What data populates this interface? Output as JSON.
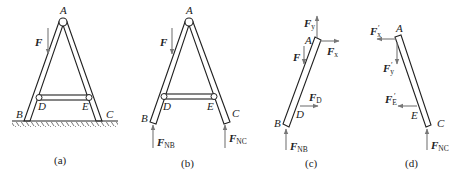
{
  "figure": {
    "panels": [
      {
        "id": "a",
        "caption": "(a)",
        "points": {
          "A": "A",
          "B": "B",
          "C": "C",
          "D": "D",
          "E": "E"
        },
        "forces": [
          {
            "name": "F",
            "sub": "",
            "prime": ""
          }
        ],
        "ground": true
      },
      {
        "id": "b",
        "caption": "(b)",
        "points": {
          "A": "A",
          "B": "B",
          "C": "C",
          "D": "D",
          "E": "E"
        },
        "forces": [
          {
            "name": "F",
            "sub": "",
            "prime": ""
          },
          {
            "name": "F",
            "sub": "NB",
            "prime": ""
          },
          {
            "name": "F",
            "sub": "NC",
            "prime": ""
          }
        ]
      },
      {
        "id": "c",
        "caption": "(c)",
        "points": {
          "A": "A",
          "B": "B",
          "D": "D"
        },
        "forces": [
          {
            "name": "F",
            "sub": "y",
            "prime": ""
          },
          {
            "name": "F",
            "sub": "x",
            "prime": ""
          },
          {
            "name": "F",
            "sub": "",
            "prime": ""
          },
          {
            "name": "F",
            "sub": "D",
            "prime": ""
          },
          {
            "name": "F",
            "sub": "NB",
            "prime": ""
          }
        ]
      },
      {
        "id": "d",
        "caption": "(d)",
        "points": {
          "A": "A",
          "C": "C",
          "E": "E"
        },
        "forces": [
          {
            "name": "F",
            "sub": "x",
            "prime": "′"
          },
          {
            "name": "F",
            "sub": "y",
            "prime": "′"
          },
          {
            "name": "F",
            "sub": "E",
            "prime": "′"
          },
          {
            "name": "F",
            "sub": "NC",
            "prime": ""
          }
        ]
      }
    ],
    "colors": {
      "line": "#222222",
      "force_arrow": "#777777",
      "background": "#ffffff"
    }
  }
}
